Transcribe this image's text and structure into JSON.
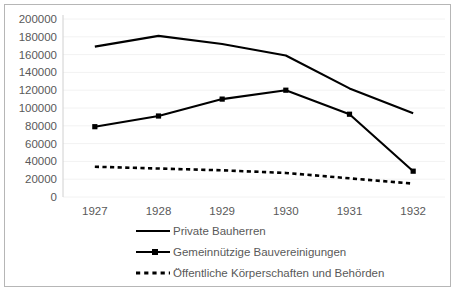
{
  "chart_data": {
    "type": "line",
    "title": "",
    "subtitle": "",
    "xlabel": "",
    "ylabel": "",
    "categories": [
      "1927",
      "1928",
      "1929",
      "1930",
      "1931",
      "1932"
    ],
    "x": [
      1927,
      1928,
      1929,
      1930,
      1931,
      1932
    ],
    "ylim": [
      0,
      200000
    ],
    "yticks": [
      0,
      20000,
      40000,
      60000,
      80000,
      100000,
      120000,
      140000,
      160000,
      180000,
      200000
    ],
    "ytick_labels": [
      "0",
      "20000",
      "40000",
      "60000",
      "80000",
      "100000",
      "120000",
      "140000",
      "160000",
      "180000",
      "200000"
    ],
    "grid": true,
    "grid_axis": "y",
    "legend_position": "bottom",
    "series": [
      {
        "name": "Private Bauherren",
        "style": "solid",
        "markers": false,
        "color": "#000000",
        "values": [
          169000,
          181000,
          172000,
          159000,
          122000,
          94000
        ]
      },
      {
        "name": "Gemeinnützige Bauvereinigungen",
        "style": "solid",
        "markers": true,
        "color": "#000000",
        "values": [
          79000,
          91000,
          110000,
          120000,
          93000,
          29000
        ]
      },
      {
        "name": "Öffentliche Körperschaften und Behörden",
        "style": "dotted",
        "markers": false,
        "color": "#000000",
        "values": [
          34000,
          32000,
          30000,
          27000,
          21000,
          15000
        ]
      }
    ]
  },
  "legend": {
    "items": [
      {
        "label": "Private Bauherren",
        "style": "solid",
        "marker": false
      },
      {
        "label": "Gemeinnützige Bauvereinigungen",
        "style": "solid",
        "marker": true
      },
      {
        "label": "Öffentliche Körperschaften und Behörden",
        "style": "dotted",
        "marker": false
      }
    ]
  }
}
